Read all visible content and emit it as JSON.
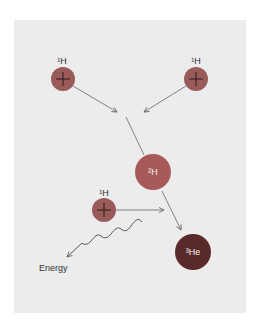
{
  "diagram": {
    "type": "proton-proton fusion chain",
    "colors": {
      "background": "#ffffff",
      "panel": "#ececec",
      "proton": "#9a5a5a",
      "deuterium": "#a85a5a",
      "helium3": "#5a2a2a",
      "arrow": "#666666"
    },
    "nodes": [
      {
        "id": "h1-top-left",
        "mass": "1",
        "symbol": "H",
        "symbol_label": "¹H",
        "has_plus": true
      },
      {
        "id": "h1-top-right",
        "mass": "1",
        "symbol": "H",
        "symbol_label": "¹H",
        "has_plus": true
      },
      {
        "id": "h2",
        "mass": "2",
        "symbol": "H",
        "symbol_label": "²H",
        "has_plus": false
      },
      {
        "id": "h1-lower",
        "mass": "1",
        "symbol": "H",
        "symbol_label": "¹H",
        "has_plus": true
      },
      {
        "id": "he3",
        "mass": "3",
        "symbol": "He",
        "symbol_label": "³He",
        "has_plus": false
      }
    ],
    "edges": [
      {
        "from": "h1-top-left",
        "to": "merge-point"
      },
      {
        "from": "h1-top-right",
        "to": "merge-point"
      },
      {
        "from": "merge-point",
        "to": "h2"
      },
      {
        "from": "h1-lower",
        "to": "merge-point-2"
      },
      {
        "from": "h2",
        "to": "he3"
      }
    ],
    "energy_label": "Energy"
  }
}
